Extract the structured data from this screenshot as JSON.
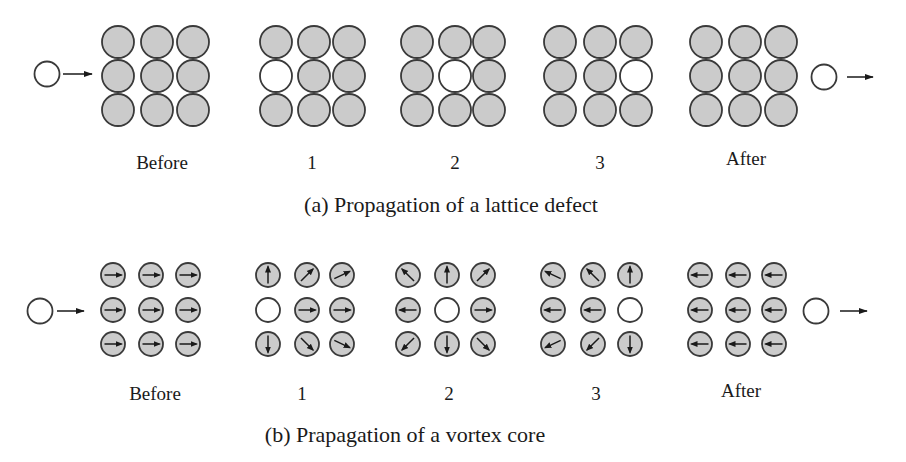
{
  "colors": {
    "filled": "#cbcbcb",
    "empty": "#ffffff",
    "stroke": "#3a3a3a",
    "arrow": "#1a1a1a"
  },
  "panel_a": {
    "caption": "(a) Propagation of a lattice defect",
    "incoming_arrow": true,
    "outgoing_arrow": true,
    "frames": [
      {
        "label": "Before",
        "empty": null
      },
      {
        "label": "1",
        "empty": [
          1,
          0
        ]
      },
      {
        "label": "2",
        "empty": [
          1,
          1
        ]
      },
      {
        "label": "3",
        "empty": [
          1,
          2
        ]
      },
      {
        "label": "After",
        "empty": null
      }
    ]
  },
  "panel_b": {
    "caption": "(b) Prapagation of a vortex core",
    "incoming_arrow": true,
    "outgoing_arrow": true,
    "frames": [
      {
        "label": "Before",
        "empty": null,
        "spins_deg": [
          [
            0,
            0,
            0
          ],
          [
            0,
            0,
            0
          ],
          [
            0,
            0,
            0
          ]
        ]
      },
      {
        "label": "1",
        "empty": [
          1,
          0
        ],
        "spins_deg": [
          [
            90,
            45,
            25
          ],
          [
            null,
            0,
            0
          ],
          [
            -90,
            -45,
            -25
          ]
        ]
      },
      {
        "label": "2",
        "empty": [
          1,
          1
        ],
        "spins_deg": [
          [
            135,
            90,
            45
          ],
          [
            180,
            null,
            0
          ],
          [
            -135,
            -90,
            -45
          ]
        ]
      },
      {
        "label": "3",
        "empty": [
          1,
          2
        ],
        "spins_deg": [
          [
            155,
            135,
            90
          ],
          [
            180,
            180,
            null
          ],
          [
            -155,
            -135,
            -90
          ]
        ]
      },
      {
        "label": "After",
        "empty": null,
        "spins_deg": [
          [
            180,
            180,
            180
          ],
          [
            180,
            180,
            180
          ],
          [
            180,
            180,
            180
          ]
        ]
      }
    ]
  }
}
